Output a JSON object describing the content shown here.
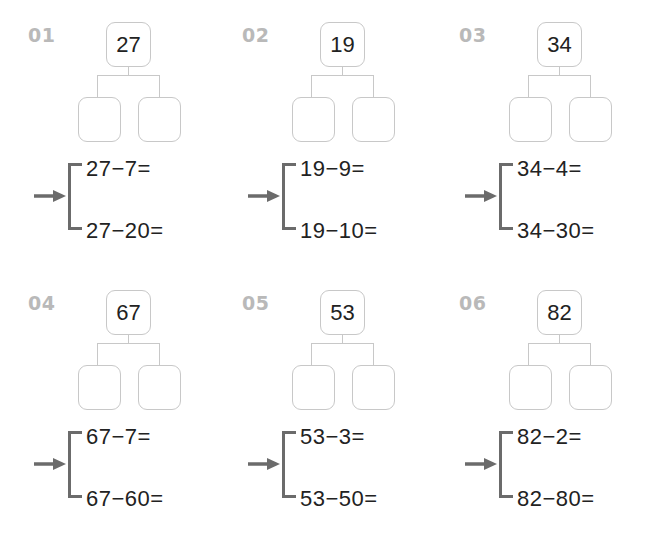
{
  "worksheet": {
    "problems": [
      {
        "label": "01",
        "whole": "27",
        "eq1": "27−7=",
        "eq2": "27−20="
      },
      {
        "label": "02",
        "whole": "19",
        "eq1": "19−9=",
        "eq2": "19−10="
      },
      {
        "label": "03",
        "whole": "34",
        "eq1": "34−4=",
        "eq2": "34−30="
      },
      {
        "label": "04",
        "whole": "67",
        "eq1": "67−7=",
        "eq2": "67−60="
      },
      {
        "label": "05",
        "whole": "53",
        "eq1": "53−3=",
        "eq2": "53−50="
      },
      {
        "label": "06",
        "whole": "82",
        "eq1": "82−2=",
        "eq2": "82−80="
      }
    ],
    "icons": {
      "arrow": "right-arrow-icon"
    },
    "colors": {
      "label": "#b9b9b9",
      "box_border": "#c8c8c8",
      "bracket": "#6b6b6b",
      "text": "#222222"
    }
  }
}
